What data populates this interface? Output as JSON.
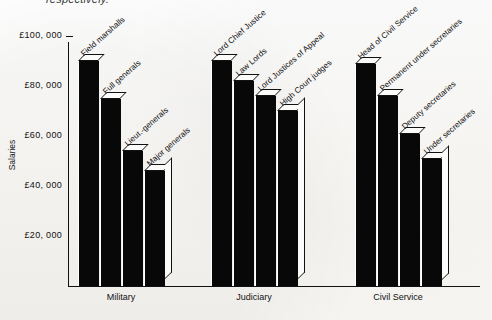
{
  "figure": {
    "clipped_caption": "respectively.",
    "ylabel": "Salaries",
    "ytick_labels": [
      "£100, 000",
      "£80, 000",
      "£60, 000",
      "£40, 000",
      "£20, 000"
    ],
    "group_labels": [
      "Military",
      "Judiciary",
      "Civil Service"
    ]
  },
  "chart_data": {
    "type": "bar",
    "title": "",
    "xlabel": "",
    "ylabel": "Salaries",
    "ylim": [
      0,
      110000
    ],
    "yticks": [
      20000,
      40000,
      60000,
      80000,
      100000
    ],
    "ytick_labels": [
      "£20, 000",
      "£40, 000",
      "£60, 000",
      "£80, 000",
      "£100, 000"
    ],
    "grid": false,
    "legend": "none",
    "groups": [
      "Military",
      "Judiciary",
      "Civil Service"
    ],
    "categories": [
      "Field marshalls",
      "Full generals",
      "Lieut.-generals",
      "Major generals",
      "Lord Chief Justice",
      "Law Lords",
      "Lord Justices of Appeal",
      "High Court judges",
      "Head of Civil Service",
      "Permanent under secretaries",
      "Deputy secretaries",
      "Under secretaries"
    ],
    "values": [
      90000,
      75000,
      54000,
      46000,
      90000,
      82000,
      76000,
      70000,
      89000,
      76000,
      61000,
      51000
    ],
    "bars": [
      {
        "group": "Military",
        "label": "Field marshalls",
        "value": 90000
      },
      {
        "group": "Military",
        "label": "Full generals",
        "value": 75000
      },
      {
        "group": "Military",
        "label": "Lieut.-generals",
        "value": 54000
      },
      {
        "group": "Military",
        "label": "Major generals",
        "value": 46000
      },
      {
        "group": "Judiciary",
        "label": "Lord Chief Justice",
        "value": 90000
      },
      {
        "group": "Judiciary",
        "label": "Law Lords",
        "value": 82000
      },
      {
        "group": "Judiciary",
        "label": "Lord Justices of Appeal",
        "value": 76000
      },
      {
        "group": "Judiciary",
        "label": "High Court judges",
        "value": 70000
      },
      {
        "group": "Civil Service",
        "label": "Head of Civil Service",
        "value": 89000
      },
      {
        "group": "Civil Service",
        "label": "Permanent under secretaries",
        "value": 76000
      },
      {
        "group": "Civil Service",
        "label": "Deputy secretaries",
        "value": 61000
      },
      {
        "group": "Civil Service",
        "label": "Under secretaries",
        "value": 51000
      }
    ],
    "colors": {
      "bar_fill": "#080808",
      "bar_edge": "#111111",
      "bar_top": "#fbfbf9",
      "axis": "#111111"
    }
  }
}
